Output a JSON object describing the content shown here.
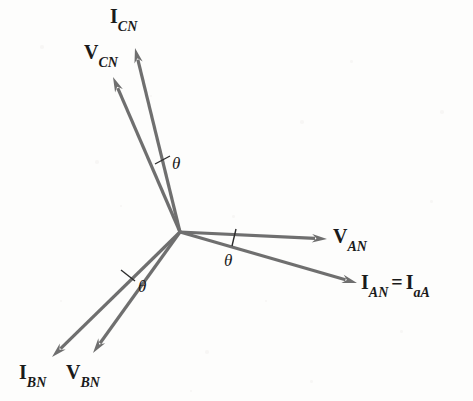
{
  "figure": {
    "background_color": "#fdfdfc",
    "vector_color": "#6f6f6f",
    "text_color": "#1a1a1a",
    "origin": {
      "x": 180,
      "y": 232
    }
  },
  "vectors": [
    {
      "id": "v-an",
      "name": "V_AN",
      "symbol": "V",
      "subscript": "AN",
      "tip": {
        "x": 327,
        "y": 239
      },
      "label_pos": {
        "x": 333,
        "y": 226
      },
      "kind": "voltage",
      "phase": "A"
    },
    {
      "id": "i-an",
      "name": "I_AN = I_aA",
      "symbol": "I",
      "subscript": "AN",
      "symbol2": "I",
      "subscript2": "aA",
      "equals": "=",
      "tip": {
        "x": 357,
        "y": 283
      },
      "label_pos": {
        "x": 361,
        "y": 272
      },
      "kind": "current",
      "phase": "A"
    },
    {
      "id": "v-cn",
      "name": "V_CN",
      "symbol": "V",
      "subscript": "CN",
      "tip": {
        "x": 113,
        "y": 77
      },
      "label_pos": {
        "x": 84,
        "y": 42
      },
      "kind": "voltage",
      "phase": "C"
    },
    {
      "id": "i-cn",
      "name": "I_CN",
      "symbol": "I",
      "subscript": "CN",
      "tip": {
        "x": 135,
        "y": 48
      },
      "label_pos": {
        "x": 110,
        "y": 6
      },
      "kind": "current",
      "phase": "C"
    },
    {
      "id": "v-bn",
      "name": "V_BN",
      "symbol": "V",
      "subscript": "BN",
      "tip": {
        "x": 93,
        "y": 353
      },
      "label_pos": {
        "x": 66,
        "y": 362
      },
      "kind": "voltage",
      "phase": "B"
    },
    {
      "id": "i-bn",
      "name": "I_BN",
      "symbol": "I",
      "subscript": "BN",
      "tip": {
        "x": 52,
        "y": 357
      },
      "label_pos": {
        "x": 19,
        "y": 362
      },
      "kind": "current",
      "phase": "B"
    }
  ],
  "angles": [
    {
      "id": "theta-a",
      "label": "θ",
      "tick": {
        "x1": 236,
        "y1": 229,
        "x2": 232,
        "y2": 246
      },
      "label_pos": {
        "x": 224,
        "y": 252
      },
      "between": [
        "V_AN",
        "I_AN"
      ]
    },
    {
      "id": "theta-c",
      "label": "θ",
      "tick": {
        "x1": 155,
        "y1": 164,
        "x2": 170,
        "y2": 156
      },
      "label_pos": {
        "x": 172,
        "y": 155
      },
      "between": [
        "V_CN",
        "I_CN"
      ]
    },
    {
      "id": "theta-b",
      "label": "θ",
      "tick": {
        "x1": 121,
        "y1": 270,
        "x2": 135,
        "y2": 281
      },
      "label_pos": {
        "x": 138,
        "y": 278
      },
      "between": [
        "I_BN",
        "V_BN"
      ]
    }
  ],
  "geometry": {
    "shaft_width": 3.2,
    "arrow_length": 15,
    "arrow_half_width": 4.2
  }
}
